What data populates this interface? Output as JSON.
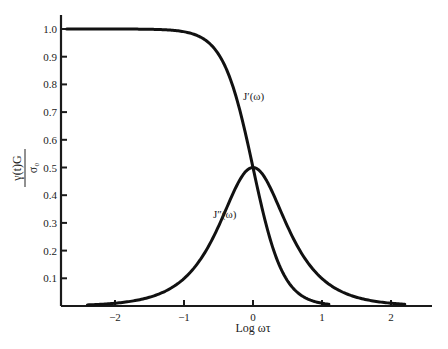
{
  "chart_data": {
    "type": "line",
    "title": "",
    "xlabel": "Log ωτ",
    "ylabel": "γ(t)G / σ₀",
    "ylabel_numerator": "γ(t)G",
    "ylabel_denominator": "σ₀",
    "xlim": [
      -2.75,
      2.6
    ],
    "ylim": [
      0,
      1.07
    ],
    "grid": false,
    "legend": "none (curves labeled inline)",
    "x_ticks": [
      -2,
      -1,
      0,
      1,
      2
    ],
    "x_tick_labels": [
      "−2",
      "−1",
      "0",
      "1",
      "2"
    ],
    "y_ticks": [
      0.1,
      0.2,
      0.3,
      0.4,
      0.5,
      0.6,
      0.7,
      0.8,
      0.9,
      1.0
    ],
    "y_tick_labels": [
      "0.1",
      "0.2",
      "0.3",
      "0.4",
      "0.5",
      "0.6",
      "0.7",
      "0.8",
      "0.9",
      "1.0"
    ],
    "series": [
      {
        "name": "J′(ω)",
        "x": [
          -2.7,
          -2.0,
          -1.5,
          -1.0,
          -0.75,
          -0.5,
          -0.25,
          0.0,
          0.25,
          0.5,
          0.75,
          1.0,
          1.1
        ],
        "values": [
          1.0,
          1.0,
          0.999,
          0.99,
          0.969,
          0.909,
          0.76,
          0.5,
          0.24,
          0.091,
          0.031,
          0.01,
          0.006
        ],
        "label_position": [
          -0.15,
          0.77
        ]
      },
      {
        "name": "J″(ω)",
        "x": [
          -2.4,
          -2.0,
          -1.5,
          -1.0,
          -0.75,
          -0.5,
          -0.25,
          0.0,
          0.25,
          0.5,
          0.75,
          1.0,
          1.5,
          2.0,
          2.2
        ],
        "values": [
          0.004,
          0.01,
          0.032,
          0.099,
          0.172,
          0.287,
          0.427,
          0.5,
          0.427,
          0.287,
          0.172,
          0.099,
          0.032,
          0.01,
          0.006
        ],
        "label_position": [
          -0.58,
          0.32
        ]
      }
    ],
    "peak": {
      "x": 0,
      "y": 0.5,
      "note": "J′ and J″ intersect at 0.5 when log ωτ = 0"
    }
  },
  "labels": {
    "x_axis_title": "Log ωτ",
    "y_num": "γ(t)G",
    "y_den": "σ₀",
    "series_jprime": "J′(ω)",
    "series_jdoubleprime": "J″(ω)"
  }
}
